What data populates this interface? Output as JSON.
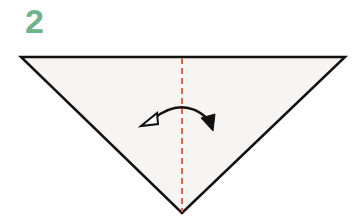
{
  "step": {
    "number": "2"
  },
  "colors": {
    "step_number": "#6fb38a",
    "paper_fill": "#f7f5f3",
    "outline": "#111111",
    "fold_line": "#e0644c",
    "arrow": "#111111"
  },
  "diagram": {
    "shape": "triangle",
    "vertices": [
      [
        21,
        57
      ],
      [
        345,
        57
      ],
      [
        182,
        213
      ]
    ],
    "fold_line": {
      "type": "valley-dashed",
      "x": 182,
      "y1": 57,
      "y2": 213
    },
    "arrow": {
      "type": "fold-and-unfold",
      "description": "curved double-headed arrow across fold line"
    }
  }
}
